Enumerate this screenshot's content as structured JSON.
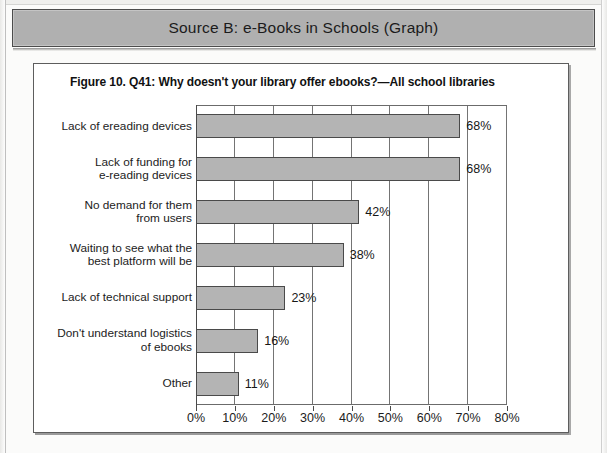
{
  "banner": {
    "title": "Source B: e-Books in Schools (Graph)"
  },
  "figure": {
    "title": "Figure 10. Q41: Why doesn't your library offer ebooks?—All school libraries"
  },
  "colors": {
    "banner_fill": "#b0b0b0",
    "bar_fill": "#b4b4b4",
    "bar_stroke": "#4a4a4a",
    "page_bg": "#fbfbfa"
  },
  "chart_data": {
    "type": "bar",
    "orientation": "horizontal",
    "title": "Figure 10. Q41: Why doesn't your library offer ebooks?—All school libraries",
    "xlabel": "",
    "ylabel": "",
    "categories": [
      "Lack of ereading devices",
      "Lack of funding for\ne-reading devices",
      "No demand for them\nfrom users",
      "Waiting to see what the\nbest platform will be",
      "Lack of technical support",
      "Don't understand logistics\nof ebooks",
      "Other"
    ],
    "values": [
      68,
      68,
      42,
      38,
      23,
      16,
      11
    ],
    "value_labels": [
      "68%",
      "68%",
      "42%",
      "38%",
      "23%",
      "16%",
      "11%"
    ],
    "xlim": [
      0,
      80
    ],
    "xticks": [
      0,
      10,
      20,
      30,
      40,
      50,
      60,
      70,
      80
    ],
    "xtick_labels": [
      "0%",
      "10%",
      "20%",
      "30%",
      "40%",
      "50%",
      "60%",
      "70%",
      "80%"
    ],
    "grid": true,
    "grid_axis": "x",
    "legend": null
  }
}
